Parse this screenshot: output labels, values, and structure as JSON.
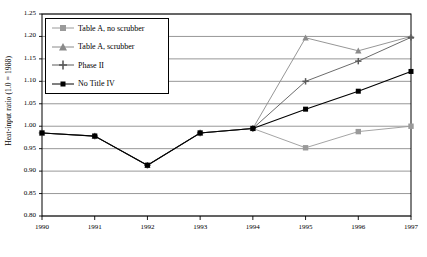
{
  "chart_data": {
    "type": "line",
    "title": "",
    "xlabel": "",
    "ylabel": "Heat-input ratio (1.0 = 1988)",
    "categories": [
      "1990",
      "1991",
      "1992",
      "1993",
      "1994",
      "1995",
      "1996",
      "1997"
    ],
    "xlim": [
      1990,
      1997
    ],
    "ylim": [
      0.8,
      1.25
    ],
    "yticks": [
      "1.25",
      "1.20",
      "1.15",
      "1.10",
      "1.05",
      "1.00",
      "0.95",
      "0.90",
      "0.85",
      "0.80"
    ],
    "ytick_values": [
      1.25,
      1.2,
      1.15,
      1.1,
      1.05,
      1.0,
      0.95,
      0.9,
      0.85,
      0.8
    ],
    "grid": "horizontal",
    "legend_position": "top-left",
    "series": [
      {
        "name": "Table A, no scrubber",
        "marker": "square",
        "color": "#9a9a9a",
        "values": [
          0.985,
          0.978,
          0.913,
          0.985,
          0.995,
          0.952,
          0.988,
          1.0
        ]
      },
      {
        "name": "Table A, scrubber",
        "marker": "triangle",
        "color": "#8a8a8a",
        "values": [
          0.985,
          0.978,
          0.913,
          0.985,
          0.995,
          1.197,
          1.168,
          1.2
        ]
      },
      {
        "name": "Phase II",
        "marker": "plus",
        "color": "#5a5a5a",
        "values": [
          0.985,
          0.978,
          0.913,
          0.985,
          0.995,
          1.1,
          1.145,
          1.198
        ]
      },
      {
        "name": "No Title IV",
        "marker": "square-filled",
        "color": "#000000",
        "values": [
          0.985,
          0.978,
          0.913,
          0.985,
          0.995,
          1.038,
          1.078,
          1.122
        ]
      }
    ]
  }
}
